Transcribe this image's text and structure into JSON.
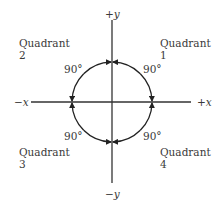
{
  "diagram": {
    "title": "",
    "axes": {
      "pos_y": "+y",
      "neg_y": "−y",
      "neg_x": "−x",
      "pos_x": "+x"
    },
    "quadrants": [
      {
        "label": "Quadrant",
        "number": "1",
        "angle": "90°"
      },
      {
        "label": "Quadrant",
        "number": "2",
        "angle": "90°"
      },
      {
        "label": "Quadrant",
        "number": "3",
        "angle": "90°"
      },
      {
        "label": "Quadrant",
        "number": "4",
        "angle": "90°"
      }
    ],
    "colors": {
      "line": "#333333",
      "text": "#3a3a3a",
      "background": "#ffffff"
    }
  }
}
